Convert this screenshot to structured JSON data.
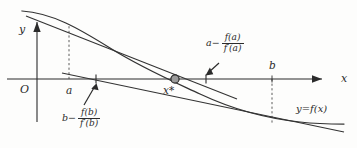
{
  "figure": {
    "type": "newton-method-diagram",
    "background_color": "#fdfdfc",
    "ink_color": "#2b2b2b",
    "axes": {
      "x_label": "x",
      "y_label": "y",
      "origin_label": "O"
    },
    "point_labels": {
      "a": "a",
      "b": "b",
      "root": "x*",
      "curve": "y=f(x)"
    },
    "expressions": {
      "newton_from_a": {
        "lead": "a−",
        "numerator": "f(a)",
        "denominator": "f′(a)"
      },
      "newton_from_b": {
        "lead": "b−",
        "numerator": "f(b)",
        "denominator": "f′(b)"
      }
    },
    "geometry": {
      "x_axis_y": 79,
      "y_axis_x": 37,
      "a_x": 69,
      "b_x": 272,
      "root_x": 174,
      "newton_a_tick_x": 206,
      "newton_b_tick_x": 96
    }
  }
}
